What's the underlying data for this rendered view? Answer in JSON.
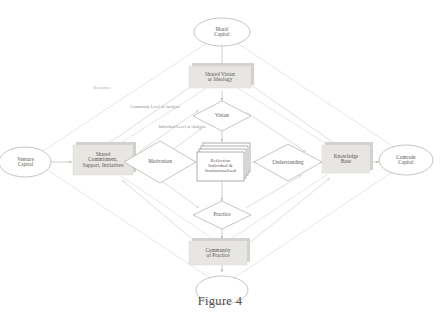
{
  "figure": {
    "caption": "Figure 4"
  },
  "diagram": {
    "title": "Figure 4",
    "type": "flow-diagram",
    "colors": {
      "stroke": "#b9b6b2",
      "stroke_faint": "#d7d4d0",
      "box_fill": "#e6e4e1",
      "shadow": "#cfcdc9",
      "text": "#55524f",
      "annotation_text": "#86837f",
      "page_background": "#ffffff"
    },
    "nodes": {
      "moral_capital": {
        "label": "Moral\nCapital",
        "line1": "Moral",
        "line2": "Capital",
        "shape": "ellipse"
      },
      "shared_vision": {
        "label": "Shared Vision\nor Ideology",
        "line1": "Shared Vision",
        "line2": "or Ideology",
        "shape": "box"
      },
      "vision": {
        "label": "Vision",
        "shape": "diamond"
      },
      "venture_capital": {
        "label": "Venture\nCapital",
        "line1": "Venture",
        "line2": "Capital",
        "shape": "ellipse"
      },
      "shared_commitment": {
        "label": "Shared\nCommitment,\nSupport, Initiatives",
        "line1": "Shared",
        "line2": "Commitment,",
        "line3": "Support, Initiatives",
        "shape": "box"
      },
      "motivation": {
        "label": "Motivation",
        "shape": "diamond"
      },
      "reflection": {
        "label": "Reflection\nIndividual &\nInstitutionalized",
        "line1": "Reflection",
        "line2": "Individual &",
        "line3": "Institutionalized",
        "shape": "stacked-document"
      },
      "understanding": {
        "label": "Understanding",
        "shape": "diamond"
      },
      "knowledge_base": {
        "label": "Knowledge\nBase",
        "line1": "Knowledge",
        "line2": "Base",
        "shape": "box"
      },
      "comrade_capital": {
        "label": "Comrade\nCapital",
        "line1": "Comrade",
        "line2": "Capital",
        "shape": "ellipse"
      },
      "practice": {
        "label": "Practice",
        "shape": "diamond"
      },
      "community_of_practice": {
        "label": "Community\nof Practice",
        "line1": "Community",
        "line2": "of Practice",
        "shape": "box"
      },
      "bottom_ellipse": {
        "label": "",
        "shape": "ellipse"
      }
    },
    "annotations": {
      "resources": {
        "label": "Resources"
      },
      "community_level": {
        "line1": "Community Level",
        "line2": "of Analysis"
      },
      "individual_level": {
        "line1": "Individual Level",
        "line2": "of Analysis"
      }
    }
  }
}
